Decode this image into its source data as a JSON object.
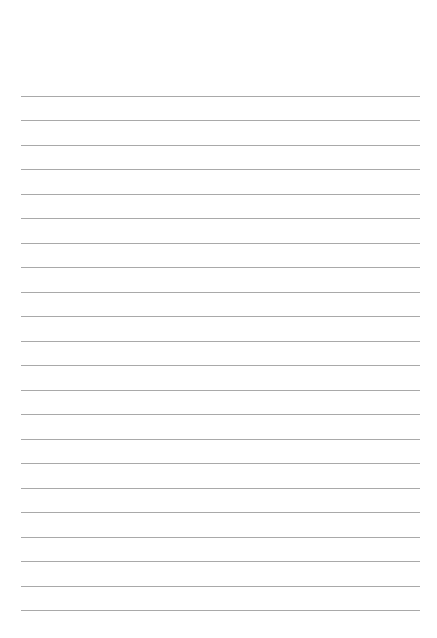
{
  "page": {
    "type": "lined-paper",
    "background_color": "#ffffff",
    "line_color": "#a9a9a9",
    "line_count": 22
  }
}
